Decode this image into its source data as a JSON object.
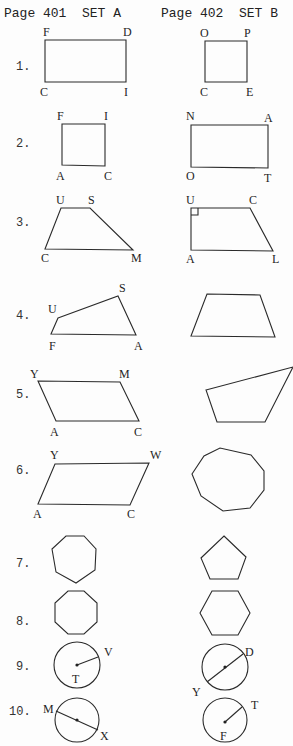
{
  "header": {
    "set_a": "Page 401  SET A",
    "set_b": "Page 402  SET B"
  },
  "problems": [
    {
      "number": "1.",
      "number_pos": [
        16,
        70
      ],
      "a": {
        "type": "polygon",
        "points": [
          [
            45,
            40
          ],
          [
            126,
            40
          ],
          [
            126,
            82
          ],
          [
            45,
            82
          ]
        ],
        "labels": [
          [
            "F",
            43,
            36
          ],
          [
            "D",
            123,
            36
          ],
          [
            "C",
            40,
            96
          ],
          [
            "I",
            124,
            96
          ]
        ]
      },
      "b": {
        "type": "polygon",
        "points": [
          [
            205,
            41
          ],
          [
            247,
            41
          ],
          [
            247,
            82
          ],
          [
            205,
            82
          ]
        ],
        "labels": [
          [
            "O",
            200,
            37
          ],
          [
            "P",
            244,
            37
          ],
          [
            "C",
            200,
            96
          ],
          [
            "E",
            246,
            96
          ]
        ]
      }
    },
    {
      "number": "2.",
      "number_pos": [
        16,
        147
      ],
      "a": {
        "type": "polygon",
        "points": [
          [
            62,
            124
          ],
          [
            105,
            124
          ],
          [
            105,
            166
          ],
          [
            62,
            165
          ]
        ],
        "labels": [
          [
            "F",
            57,
            120
          ],
          [
            "I",
            104,
            120
          ],
          [
            "A",
            56,
            180
          ],
          [
            "C",
            104,
            180
          ]
        ]
      },
      "b": {
        "type": "polygon",
        "points": [
          [
            191,
            125
          ],
          [
            268,
            125
          ],
          [
            268,
            168
          ],
          [
            191,
            167
          ]
        ],
        "labels": [
          [
            "N",
            186,
            120
          ],
          [
            "A",
            264,
            122
          ],
          [
            "O",
            186,
            180
          ],
          [
            "T",
            264,
            182
          ]
        ]
      }
    },
    {
      "number": "3.",
      "number_pos": [
        16,
        226
      ],
      "a": {
        "type": "polygon",
        "points": [
          [
            61,
            208
          ],
          [
            90,
            208
          ],
          [
            133,
            250
          ],
          [
            45,
            249
          ]
        ],
        "labels": [
          [
            "U",
            56,
            204
          ],
          [
            "S",
            88,
            204
          ],
          [
            "C",
            41,
            262
          ],
          [
            "M",
            131,
            262
          ]
        ]
      },
      "b": {
        "type": "polygon",
        "points": [
          [
            191,
            208
          ],
          [
            250,
            208
          ],
          [
            273,
            251
          ],
          [
            191,
            250
          ]
        ],
        "labels": [
          [
            "U",
            186,
            204
          ],
          [
            "C",
            249,
            204
          ],
          [
            "A",
            186,
            263
          ],
          [
            "L",
            272,
            263
          ]
        ]
      },
      "b_right_angle": [
        191,
        208,
        7
      ]
    },
    {
      "number": "4.",
      "number_pos": [
        16,
        319
      ],
      "a": {
        "type": "polygon",
        "points": [
          [
            58,
            318
          ],
          [
            118,
            296
          ],
          [
            136,
            335
          ],
          [
            51,
            334
          ]
        ],
        "labels": [
          [
            "S",
            119,
            292
          ],
          [
            "U",
            48,
            313
          ],
          [
            "F",
            49,
            350
          ],
          [
            "A",
            134,
            350
          ]
        ]
      },
      "b": {
        "type": "polygon",
        "points": [
          [
            207,
            294
          ],
          [
            260,
            295
          ],
          [
            275,
            337
          ],
          [
            191,
            336
          ]
        ],
        "labels": []
      }
    },
    {
      "number": "5.",
      "number_pos": [
        16,
        398
      ],
      "a": {
        "type": "polygon",
        "points": [
          [
            38,
            381
          ],
          [
            120,
            382
          ],
          [
            139,
            421
          ],
          [
            56,
            421
          ]
        ],
        "labels": [
          [
            "Y",
            30,
            378
          ],
          [
            "M",
            119,
            378
          ],
          [
            "A",
            50,
            436
          ],
          [
            "C",
            134,
            436
          ]
        ]
      },
      "b": {
        "type": "polygon",
        "points": [
          [
            206,
            390
          ],
          [
            293,
            367
          ],
          [
            265,
            422
          ],
          [
            217,
            422
          ]
        ],
        "labels": []
      }
    },
    {
      "number": "6.",
      "number_pos": [
        16,
        474
      ],
      "a": {
        "type": "polygon",
        "points": [
          [
            55,
            464
          ],
          [
            149,
            463
          ],
          [
            130,
            505
          ],
          [
            38,
            504
          ]
        ],
        "labels": [
          [
            "Y",
            50,
            459
          ],
          [
            "W",
            150,
            459
          ],
          [
            "A",
            33,
            518
          ],
          [
            "C",
            127,
            518
          ]
        ]
      },
      "b": {
        "type": "polygon",
        "points": [
          [
            192,
            474
          ],
          [
            204,
            456
          ],
          [
            220,
            448
          ],
          [
            251,
            455
          ],
          [
            264,
            471
          ],
          [
            264,
            490
          ],
          [
            250,
            508
          ],
          [
            223,
            511
          ],
          [
            201,
            496
          ]
        ],
        "labels": []
      }
    },
    {
      "number": "7.",
      "number_pos": [
        16,
        567
      ],
      "a": {
        "type": "polygon",
        "points": [
          [
            66,
            536
          ],
          [
            84,
            536
          ],
          [
            96,
            549
          ],
          [
            95,
            570
          ],
          [
            76,
            583
          ],
          [
            56,
            572
          ],
          [
            52,
            549
          ]
        ],
        "labels": []
      },
      "b": {
        "type": "polygon",
        "points": [
          [
            224,
            536
          ],
          [
            246,
            557
          ],
          [
            238,
            579
          ],
          [
            210,
            579
          ],
          [
            201,
            558
          ]
        ],
        "labels": []
      }
    },
    {
      "number": "8.",
      "number_pos": [
        16,
        625
      ],
      "a": {
        "type": "polygon",
        "points": [
          [
            68,
            591
          ],
          [
            84,
            591
          ],
          [
            97,
            603
          ],
          [
            97,
            622
          ],
          [
            84,
            634
          ],
          [
            68,
            634
          ],
          [
            55,
            622
          ],
          [
            55,
            603
          ]
        ],
        "labels": []
      },
      "b": {
        "type": "polygon",
        "points": [
          [
            212,
            591
          ],
          [
            238,
            591
          ],
          [
            250,
            613
          ],
          [
            238,
            635
          ],
          [
            212,
            635
          ],
          [
            200,
            613
          ]
        ],
        "labels": []
      }
    },
    {
      "number": "9.",
      "number_pos": [
        16,
        670
      ],
      "a": {
        "type": "circle",
        "cx": 77,
        "cy": 665,
        "r": 23,
        "line": [
          [
            77,
            665
          ],
          [
            98,
            657
          ]
        ],
        "dots": [
          [
            77,
            665
          ]
        ],
        "labels": [
          [
            "V",
            104,
            656
          ],
          [
            "T",
            72,
            683
          ]
        ]
      },
      "b": {
        "type": "circle",
        "cx": 225,
        "cy": 667,
        "r": 23,
        "line": [
          [
            207,
            682
          ],
          [
            243,
            654
          ]
        ],
        "dots": [
          [
            225,
            667
          ]
        ],
        "labels": [
          [
            "D",
            245,
            656
          ],
          [
            "Y",
            192,
            696
          ]
        ]
      }
    },
    {
      "number": "10.",
      "number_pos": [
        9,
        715
      ],
      "a": {
        "type": "circle",
        "cx": 77,
        "cy": 720,
        "r": 22,
        "line": [
          [
            56,
            711
          ],
          [
            98,
            730
          ]
        ],
        "dots": [
          [
            77,
            720
          ]
        ],
        "labels": [
          [
            "M",
            43,
            713
          ],
          [
            "X",
            100,
            740
          ]
        ]
      },
      "b": {
        "type": "circle",
        "cx": 225,
        "cy": 720,
        "r": 22,
        "line": [
          [
            225,
            722
          ],
          [
            242,
            707
          ]
        ],
        "dots": [
          [
            225,
            722
          ]
        ],
        "labels": [
          [
            "T",
            251,
            709
          ],
          [
            "F",
            220,
            740
          ]
        ]
      }
    }
  ]
}
